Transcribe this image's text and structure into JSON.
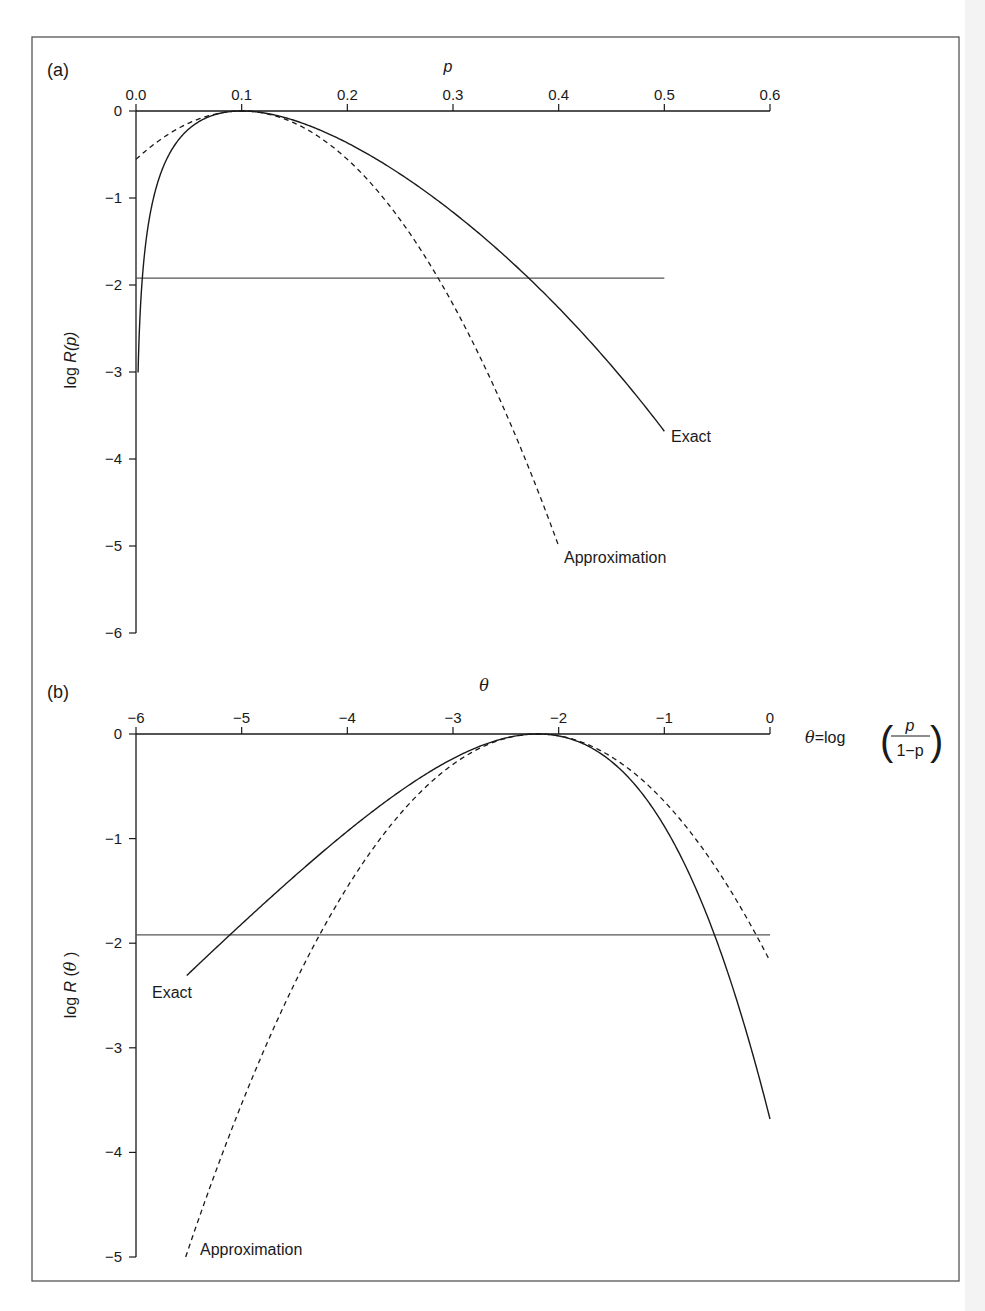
{
  "figure": {
    "frame": {
      "left": 32,
      "top": 37,
      "right": 959,
      "bottom": 1281
    },
    "line_color": "#1a1a1a",
    "ref_line_color": "#555555"
  },
  "chart_data": [
    {
      "type": "line",
      "panel_label": "(a)",
      "title": "",
      "xlabel": "p",
      "ylabel": "log R(p)",
      "xlim": [
        0.0,
        0.6
      ],
      "ylim": [
        -6,
        0
      ],
      "x_ticks": [
        "0.0",
        "0.1",
        "0.2",
        "0.3",
        "0.4",
        "0.5",
        "0.6"
      ],
      "y_ticks": [
        "0",
        "−1",
        "−2",
        "−3",
        "−4",
        "−5",
        "−6"
      ],
      "x_axis_position": "top",
      "grid": false,
      "legend": "inline labels",
      "model": {
        "n": 10,
        "x": 1,
        "p_hat": 0.1
      },
      "reference_line": {
        "y": -1.92,
        "x_from": 0.0,
        "x_to": 0.5
      },
      "series": [
        {
          "name": "Exact",
          "style": "solid",
          "x": [
            0.002,
            0.005,
            0.01,
            0.02,
            0.05,
            0.1,
            0.15,
            0.2,
            0.3,
            0.4,
            0.5
          ],
          "values": [
            -3.62,
            -2.62,
            -1.45,
            -0.84,
            -0.21,
            0.0,
            -0.11,
            -0.37,
            -1.16,
            -2.26,
            -3.68
          ]
        },
        {
          "name": "Approximation",
          "style": "dashed",
          "x": [
            0.0,
            0.05,
            0.1,
            0.15,
            0.2,
            0.25,
            0.3,
            0.35,
            0.4
          ],
          "values": [
            -0.56,
            -0.14,
            0.0,
            -0.14,
            -0.56,
            -1.25,
            -2.22,
            -3.47,
            -5.0
          ]
        }
      ],
      "annotations": [
        {
          "text": "Exact",
          "near": [
            0.5,
            -3.68
          ]
        },
        {
          "text": "Approximation",
          "near": [
            0.4,
            -5.0
          ]
        }
      ]
    },
    {
      "type": "line",
      "panel_label": "(b)",
      "title": "",
      "xlabel": "θ",
      "ylabel": "log R(θ)",
      "xlim": [
        -6,
        0
      ],
      "ylim": [
        -5,
        0
      ],
      "x_ticks": [
        "−6",
        "−5",
        "−4",
        "−3",
        "−2",
        "−1",
        "0"
      ],
      "y_ticks": [
        "0",
        "−1",
        "−2",
        "−3",
        "−4",
        "−5"
      ],
      "x_axis_position": "top",
      "grid": false,
      "legend": "inline labels",
      "axis_note": "θ=log(p/(1−p))",
      "model": {
        "n": 10,
        "x": 1,
        "theta_hat": -2.197
      },
      "reference_line": {
        "y": -1.92,
        "x_from": -6,
        "x_to": 0
      },
      "series": [
        {
          "name": "Exact",
          "style": "solid",
          "x": [
            -5.52,
            -5.0,
            -4.5,
            -4.0,
            -3.5,
            -3.0,
            -2.5,
            -2.197,
            -2.0,
            -1.5,
            -1.0,
            -0.5,
            0.0
          ],
          "values": [
            -2.31,
            -1.82,
            -1.36,
            -0.93,
            -0.55,
            -0.24,
            -0.04,
            0.0,
            -0.02,
            -0.26,
            -0.88,
            -1.99,
            -3.68
          ]
        },
        {
          "name": "Approximation",
          "style": "dashed",
          "x": [
            -5.53,
            -5.0,
            -4.5,
            -4.0,
            -3.5,
            -3.0,
            -2.5,
            -2.197,
            -2.0,
            -1.5,
            -1.0,
            -0.5,
            0.0
          ],
          "values": [
            -5.0,
            -3.53,
            -2.39,
            -1.46,
            -0.76,
            -0.29,
            -0.04,
            0.0,
            -0.02,
            -0.22,
            -0.65,
            -1.3,
            -2.17
          ]
        }
      ],
      "annotations": [
        {
          "text": "Exact",
          "near": [
            -5.52,
            -2.31
          ]
        },
        {
          "text": "Approximation",
          "near": [
            -5.53,
            -5.0
          ]
        }
      ]
    }
  ],
  "labels": {
    "panel_a": "(a)",
    "panel_b": "(b)",
    "a_xlabel": "p",
    "a_ylabel": "log R(p)",
    "a_exact": "Exact",
    "a_approx": "Approximation",
    "b_xlabel": "θ",
    "b_ylabel": "log R(θ)",
    "b_exact": "Exact",
    "b_approx": "Approximation",
    "b_note_lhs": "θ=log",
    "b_note_num": "p",
    "b_note_den": "1−p"
  }
}
